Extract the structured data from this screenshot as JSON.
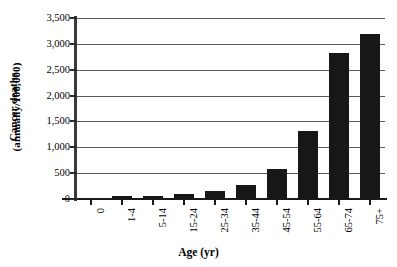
{
  "chart_data": {
    "type": "bar",
    "title": "",
    "xlabel": "Age (yr)",
    "ylabel": "Cancer deaths (annually/100,000)",
    "ylabel_lines": [
      "Cancer deaths",
      "(annually/100,000)"
    ],
    "categories": [
      "0",
      "1-4",
      "5-14",
      "15-24",
      "25-34",
      "35-44",
      "45-54",
      "55-64",
      "65-74",
      "75+"
    ],
    "values": [
      0,
      50,
      60,
      90,
      150,
      270,
      580,
      1320,
      2830,
      3200
    ],
    "ylim": [
      0,
      3500
    ],
    "yticks": [
      0,
      500,
      1000,
      1500,
      2000,
      2500,
      3000,
      3500
    ],
    "ytick_labels": [
      "0",
      "500",
      "1,000",
      "1,500",
      "2,000",
      "2,500",
      "3,000",
      "3,500"
    ],
    "grid": true,
    "legend": "none",
    "bar_color": "#171717",
    "axis_color": "#1a1a1a",
    "grid_color": "#5a5a5a",
    "background": "#ffffff"
  }
}
